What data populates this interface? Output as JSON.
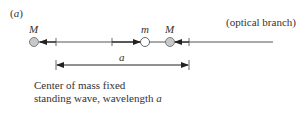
{
  "panel_label": "(a)",
  "branch_label": "(optical branch)",
  "masses": {
    "left_heavy": "M",
    "light": "m",
    "right_heavy": "M"
  },
  "dimension_label": "a",
  "caption": {
    "line1": "Center of mass fixed",
    "line2_prefix": "standing wave, wavelength ",
    "line2_var": "a"
  },
  "colors": {
    "heavy_mass_fill": "#c8c8c8",
    "light_mass_fill": "#ffffff",
    "stroke": "#333333"
  }
}
